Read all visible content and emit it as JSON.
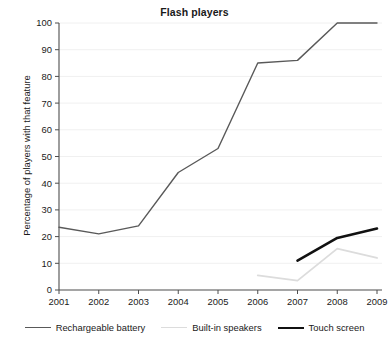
{
  "chart_data": {
    "type": "line",
    "title": "Flash players",
    "xlabel": "",
    "ylabel": "Percentage of players with that feature",
    "x": [
      2001,
      2002,
      2003,
      2004,
      2005,
      2006,
      2007,
      2008,
      2009
    ],
    "xtick_labels": [
      "2001",
      "2002",
      "2003",
      "2004",
      "2005",
      "2006",
      "2007",
      "2008",
      "2009"
    ],
    "ytick_labels": [
      "0",
      "10",
      "20",
      "30",
      "40",
      "50",
      "60",
      "70",
      "80",
      "90",
      "100"
    ],
    "yticks": [
      0,
      10,
      20,
      30,
      40,
      50,
      60,
      70,
      80,
      90,
      100
    ],
    "ylim": [
      0,
      100
    ],
    "xlim": [
      2001,
      2009
    ],
    "grid": "horizontal",
    "legend_position": "bottom",
    "series": [
      {
        "name": "Rechargeable battery",
        "color": "#595959",
        "width": 1.4,
        "x": [
          2001,
          2002,
          2003,
          2004,
          2005,
          2006,
          2007,
          2008,
          2009
        ],
        "values": [
          23.5,
          21,
          24,
          44,
          53,
          85,
          86,
          100,
          100
        ]
      },
      {
        "name": "Built-in speakers",
        "color": "#dcdcdc",
        "width": 1.8,
        "x": [
          2006,
          2007,
          2008,
          2009
        ],
        "values": [
          5.5,
          3.5,
          15.5,
          12
        ]
      },
      {
        "name": "Touch screen",
        "color": "#111111",
        "width": 2.6,
        "x": [
          2007,
          2008,
          2009
        ],
        "values": [
          11,
          19.5,
          23
        ]
      }
    ]
  },
  "legend": {
    "items": [
      {
        "label": "Rechargeable battery",
        "color": "#595959",
        "thickness": 1.4
      },
      {
        "label": "Built-in speakers",
        "color": "#dcdcdc",
        "thickness": 1.8
      },
      {
        "label": "Touch screen",
        "color": "#111111",
        "thickness": 2.6
      }
    ]
  },
  "axes": {
    "axis_color": "#4d4d4d",
    "grid_color": "#f0f0f0",
    "tick_color": "#4d4d4d",
    "text_color": "#1a1a1a"
  }
}
